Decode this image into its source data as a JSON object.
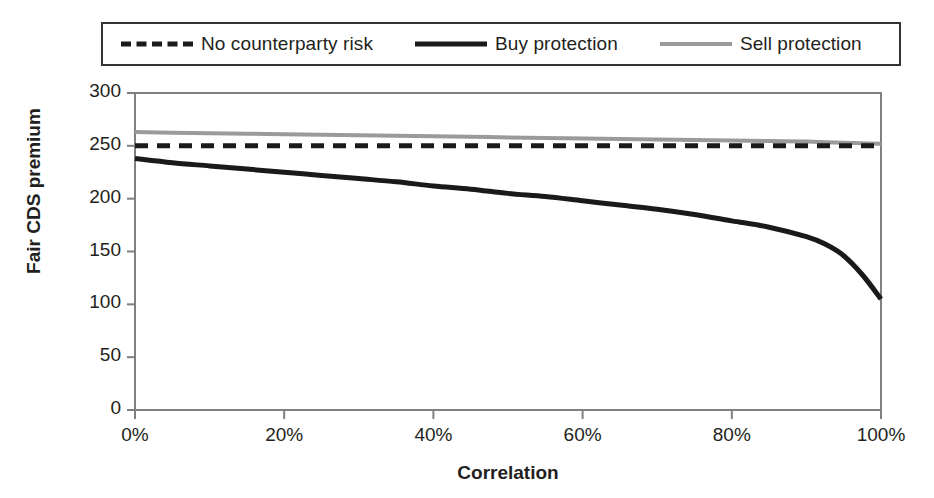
{
  "chart_data": {
    "type": "line",
    "title": "",
    "xlabel": "Correlation",
    "ylabel": "Fair CDS premium",
    "xlim": [
      0,
      100
    ],
    "ylim": [
      0,
      300
    ],
    "grid": false,
    "legend_position": "top",
    "x_tick_labels": [
      "0%",
      "20%",
      "40%",
      "60%",
      "80%",
      "100%"
    ],
    "x_ticks": [
      0,
      20,
      40,
      60,
      80,
      100
    ],
    "y_tick_labels": [
      "0",
      "50",
      "100",
      "150",
      "200",
      "250",
      "300"
    ],
    "y_ticks": [
      0,
      50,
      100,
      150,
      200,
      250,
      300
    ],
    "x": [
      0,
      5,
      10,
      15,
      20,
      25,
      30,
      35,
      40,
      45,
      50,
      55,
      60,
      65,
      70,
      75,
      80,
      85,
      90,
      92.5,
      95,
      97.5,
      100
    ],
    "series": [
      {
        "name": "No counterparty risk",
        "style": "dashed",
        "color": "#1a1a1a",
        "values": [
          250,
          250,
          250,
          250,
          250,
          250,
          250,
          250,
          250,
          250,
          250,
          250,
          250,
          250,
          250,
          250,
          250,
          250,
          250,
          250,
          250,
          250,
          250
        ]
      },
      {
        "name": "Buy protection",
        "style": "solid",
        "color": "#1a1a1a",
        "values": [
          238,
          234,
          231,
          228,
          225,
          222,
          219,
          216,
          212,
          209,
          205,
          202,
          198,
          194,
          190,
          185,
          179,
          173,
          164,
          157,
          146,
          128,
          105
        ]
      },
      {
        "name": "Sell protection",
        "style": "solid",
        "color": "#9a9a9a",
        "values": [
          263,
          262.5,
          262,
          261.5,
          261,
          260.5,
          260,
          259.5,
          259,
          258.5,
          258,
          257.5,
          257,
          256.5,
          256,
          255.5,
          255,
          254.5,
          254,
          253.5,
          253,
          252.5,
          252
        ]
      }
    ]
  },
  "legend": {
    "entries": [
      {
        "label": "No counterparty risk"
      },
      {
        "label": "Buy protection"
      },
      {
        "label": "Sell protection"
      }
    ]
  },
  "axes": {
    "x_title": "Correlation",
    "y_title": "Fair CDS premium"
  }
}
